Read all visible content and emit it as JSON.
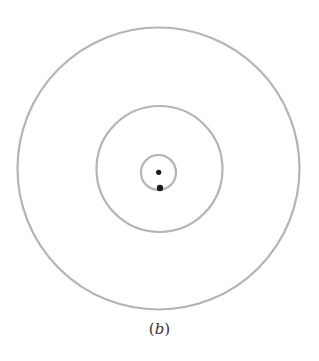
{
  "figure": {
    "caption_open": "(",
    "caption_letter": "b",
    "caption_close": ")",
    "ring_color": "#b4b4b4",
    "dot_color": "#1a1a1a",
    "circles": [
      {
        "name": "outer-circle",
        "cx": 158.5,
        "cy": 168.5,
        "r": 141
      },
      {
        "name": "middle-circle",
        "cx": 159.5,
        "cy": 169,
        "r": 63
      },
      {
        "name": "inner-circle",
        "cx": 158.5,
        "cy": 172.5,
        "r": 17.5
      }
    ],
    "dots": [
      {
        "name": "center-dot",
        "cx": 158.7,
        "cy": 172.3,
        "r": 2.6
      },
      {
        "name": "orbit-dot",
        "cx": 160,
        "cy": 188,
        "r": 3.2
      }
    ]
  }
}
